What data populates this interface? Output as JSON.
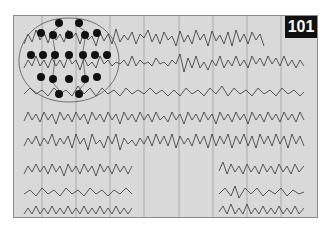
{
  "figure": {
    "badge_number": "101",
    "background_color": "#d9d9d9",
    "trace_color": "#333333",
    "trace_count": 8,
    "gridline_x": [
      28,
      62,
      96,
      130,
      165,
      199,
      233,
      267
    ]
  },
  "montage": {
    "electrodes": [
      "Fp1",
      "Fp2",
      "F7",
      "F3",
      "Fz",
      "F4",
      "F8",
      "T3",
      "C3",
      "Cz",
      "C4",
      "T4",
      "T5",
      "P3",
      "Pz",
      "P4",
      "T6",
      "O1",
      "O2",
      "A1",
      "A2"
    ],
    "arrow_labels": [
      "1",
      "2",
      "3",
      "4",
      "5",
      "6",
      "7",
      "8"
    ]
  }
}
